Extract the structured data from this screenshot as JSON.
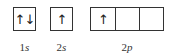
{
  "orbitals": [
    {
      "id": "1s",
      "label_num": "1",
      "label_sub": "s",
      "cells": [
        "↑↓"
      ]
    },
    {
      "id": "2s",
      "label_num": "2",
      "label_sub": "s",
      "cells": [
        "↑"
      ]
    },
    {
      "id": "2p",
      "label_num": "2",
      "label_sub": "p",
      "cells": [
        "↑",
        "",
        ""
      ]
    }
  ],
  "colors": {
    "line": "#333333",
    "text": "#222222",
    "background": "#ffffff"
  }
}
